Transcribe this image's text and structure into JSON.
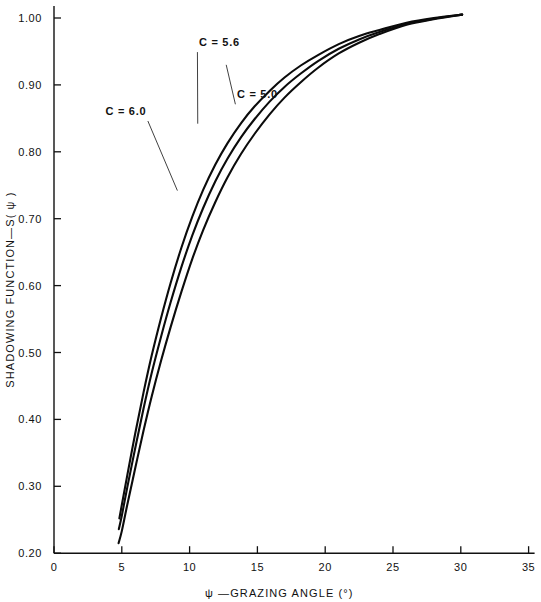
{
  "chart_data": {
    "type": "line",
    "title": "",
    "xlabel": "ψ —GRAZING ANGLE (°)",
    "ylabel": "SHADOWING FUNCTION—S( ψ )",
    "xlim": [
      0,
      35
    ],
    "ylim": [
      0.2,
      1.0
    ],
    "grid": false,
    "legend_position": "inline-annotations",
    "xticks": [
      0,
      5,
      10,
      15,
      20,
      25,
      30,
      35
    ],
    "xtick_labels": [
      "0",
      "5",
      "10",
      "15",
      "20",
      "25",
      "30",
      "35"
    ],
    "yticks": [
      0.2,
      0.3,
      0.4,
      0.5,
      0.6,
      0.7,
      0.8,
      0.9,
      1.0
    ],
    "ytick_labels": [
      "0.20",
      "0.30",
      "0.40",
      "0.50",
      "0.60",
      "0.70",
      "0.80",
      "0.90",
      "1.00"
    ],
    "series": [
      {
        "name": "C = 6.0",
        "label": "C = 6.0",
        "x": [
          4.82,
          5.0,
          5.4,
          6.0,
          6.6,
          7.2,
          7.9,
          8.6,
          9.4,
          10.2,
          11.0,
          11.9,
          12.8,
          13.8,
          14.8,
          15.9,
          17.0,
          18.2,
          19.5,
          21.0,
          22.5,
          24.0,
          26.0,
          28.0,
          30.1
        ],
        "values": [
          0.252,
          0.272,
          0.316,
          0.38,
          0.44,
          0.495,
          0.552,
          0.604,
          0.657,
          0.703,
          0.743,
          0.781,
          0.813,
          0.843,
          0.868,
          0.891,
          0.911,
          0.929,
          0.945,
          0.961,
          0.973,
          0.982,
          0.993,
          1.0,
          1.005
        ]
      },
      {
        "name": "C = 5.6",
        "label": "C = 5.6",
        "x": [
          4.78,
          5.0,
          5.4,
          6.0,
          6.6,
          7.2,
          7.9,
          8.6,
          9.4,
          10.2,
          11.0,
          11.9,
          12.8,
          13.8,
          14.8,
          15.9,
          17.0,
          18.2,
          19.5,
          21.0,
          22.5,
          24.0,
          26.0,
          28.0,
          30.1
        ],
        "values": [
          0.236,
          0.256,
          0.298,
          0.358,
          0.416,
          0.469,
          0.524,
          0.575,
          0.628,
          0.675,
          0.716,
          0.756,
          0.79,
          0.822,
          0.849,
          0.875,
          0.897,
          0.917,
          0.936,
          0.954,
          0.968,
          0.979,
          0.991,
          0.999,
          1.005
        ]
      },
      {
        "name": "C = 5.0",
        "label": "C = 5.0",
        "x": [
          4.76,
          5.0,
          5.4,
          6.0,
          6.6,
          7.2,
          7.9,
          8.6,
          9.4,
          10.2,
          11.0,
          11.9,
          12.8,
          13.8,
          14.8,
          15.9,
          17.0,
          18.2,
          19.5,
          21.0,
          22.5,
          24.0,
          26.0,
          28.0,
          30.1
        ],
        "values": [
          0.215,
          0.233,
          0.272,
          0.328,
          0.383,
          0.434,
          0.488,
          0.538,
          0.591,
          0.64,
          0.683,
          0.725,
          0.762,
          0.797,
          0.827,
          0.856,
          0.881,
          0.904,
          0.926,
          0.947,
          0.963,
          0.976,
          0.99,
          0.998,
          1.005
        ]
      }
    ],
    "annotations": [
      {
        "text": "C = 5.6",
        "text_x": 12.2,
        "text_y": 0.958,
        "point_x": 10.6,
        "point_y": 0.842
      },
      {
        "text": "C = 6.0",
        "text_x": 5.3,
        "text_y": 0.855,
        "point_x": 9.1,
        "point_y": 0.742
      },
      {
        "text": "C = 5.0",
        "text_x": 15.0,
        "text_y": 0.88,
        "point_x": 12.7,
        "point_y": 0.93
      }
    ]
  }
}
